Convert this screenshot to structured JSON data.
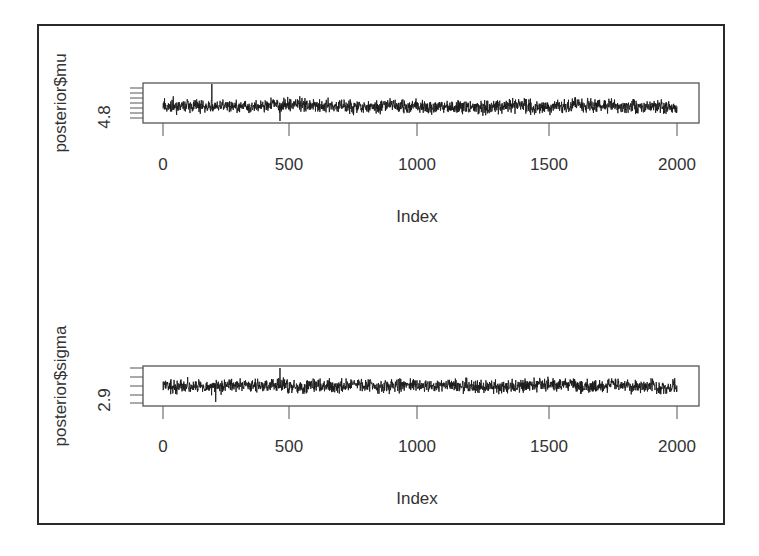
{
  "chart_data": [
    {
      "type": "line",
      "title": "",
      "xlabel": "Index",
      "ylabel": "posterior$mu",
      "x_ticks": [
        0,
        500,
        1000,
        1500,
        2000
      ],
      "x_tick_labels": [
        "0",
        "500",
        "1000",
        "1500",
        "2000"
      ],
      "xlim": [
        -80,
        2080
      ],
      "y_tick_labels_visible": [
        "4.8"
      ],
      "y_tick_count": 7,
      "n_points": 2000,
      "series": [
        {
          "name": "posterior$mu trace",
          "approx_center": 4.8,
          "description": "stationary MCMC trace, dense noise around 4.8, one spike near index 190"
        }
      ],
      "grid": false,
      "legend": null
    },
    {
      "type": "line",
      "title": "",
      "xlabel": "Index",
      "ylabel": "posterior$sigma",
      "x_ticks": [
        0,
        500,
        1000,
        1500,
        2000
      ],
      "x_tick_labels": [
        "0",
        "500",
        "1000",
        "1500",
        "2000"
      ],
      "xlim": [
        -80,
        2080
      ],
      "y_tick_labels_visible": [
        "2.9"
      ],
      "y_tick_count": 5,
      "n_points": 2000,
      "series": [
        {
          "name": "posterior$sigma trace",
          "approx_center": 2.9,
          "description": "stationary MCMC trace, dense noise around 2.9"
        }
      ],
      "grid": false,
      "legend": null
    }
  ],
  "panels": [
    {
      "ylabel": "posterior$mu",
      "ytick_label": "4.8",
      "xlabel": "Index",
      "xticks": [
        "0",
        "500",
        "1000",
        "1500",
        "2000"
      ],
      "box": {
        "x": 143,
        "y": 83,
        "w": 556,
        "h": 40
      },
      "ytick_ys": [
        88,
        93,
        98,
        103,
        108,
        113,
        118
      ],
      "ytick_label_y": 117,
      "ylabel_y": 103,
      "tick_label_y": 170,
      "index_y": 222,
      "trace": {
        "center": 106,
        "amp": 6.5,
        "seed": 7,
        "spikes": [
          [
            190,
            84
          ],
          [
            455,
            121
          ]
        ]
      }
    },
    {
      "ylabel": "posterior$sigma",
      "ytick_label": "2.9",
      "xlabel": "Index",
      "xticks": [
        "0",
        "500",
        "1000",
        "1500",
        "2000"
      ],
      "box": {
        "x": 143,
        "y": 366,
        "w": 556,
        "h": 40
      },
      "ytick_ys": [
        368,
        377,
        386,
        395,
        403
      ],
      "ytick_label_y": 400,
      "ylabel_y": 386,
      "tick_label_y": 452,
      "index_y": 504,
      "trace": {
        "center": 386,
        "amp": 6.5,
        "seed": 13,
        "spikes": [
          [
            455,
            368
          ],
          [
            205,
            402
          ]
        ]
      }
    }
  ],
  "xtick_px": [
    163,
    289,
    417,
    549,
    677
  ],
  "colors": {
    "trace": "#1a1a1a",
    "axis": "#555555",
    "frame": "#2a2a2a",
    "text": "#333333"
  }
}
